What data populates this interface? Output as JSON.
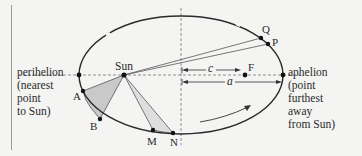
{
  "diagram": {
    "labels": {
      "perihelion": "perihelion\n(nearest\npoint\nto Sun)",
      "aphelion": "aphelion\n(point\nfurthest\naway\nfrom Sun)",
      "sun": "Sun",
      "focus": "F",
      "c": "c",
      "a": "a",
      "points": {
        "A": "A",
        "B": "B",
        "M": "M",
        "N": "N",
        "P": "P",
        "Q": "Q"
      }
    },
    "colors": {
      "background": "#f4f4f3",
      "orbit": "#2a2a2a",
      "swept_area_AB": "#c9c9c9",
      "swept_area_MN": "#dcdcdc",
      "dashed_axis": "#777777",
      "left_rule": "#9a9a9a"
    },
    "geometry": {
      "ellipse": {
        "cx": 181,
        "cy": 75,
        "rx": 102,
        "ry": 59
      },
      "sun": [
        124,
        75
      ],
      "focus": [
        245,
        75
      ],
      "perihelion": [
        79,
        75
      ],
      "aphelion": [
        283,
        75
      ],
      "A": [
        83,
        91
      ],
      "B": [
        100,
        119
      ],
      "M": [
        153,
        130
      ],
      "N": [
        173,
        133
      ],
      "P": [
        268,
        44
      ],
      "Q": [
        261,
        38
      ]
    }
  }
}
